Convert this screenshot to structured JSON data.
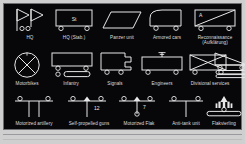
{
  "diagram": {
    "background_color": "#07070a",
    "stroke_color": "#e8e8e8",
    "plate_border_color": "#6e6e72",
    "rows": [
      {
        "items": [
          {
            "label": "HQ",
            "icon": "hq-double-pennant-icon",
            "annotation": ""
          },
          {
            "label": "HQ (Stab.)",
            "icon": "hq-stab-box-icon",
            "annotation": "St"
          },
          {
            "label": "Panzer unit",
            "icon": "panzer-parallelogram-icon",
            "annotation": ""
          },
          {
            "label": "Armored cars",
            "icon": "armored-car-icon",
            "annotation": ""
          },
          {
            "label": "Reconnaissance (Aufklärung)",
            "icon": "reconnaissance-diagonal-icon",
            "annotation": "A"
          }
        ]
      },
      {
        "items": [
          {
            "label": "Motorbikes",
            "icon": "motorbikes-circle-cross-icon",
            "annotation": ""
          },
          {
            "label": "Infantry",
            "icon": "infantry-box-bar-icon",
            "annotation": ""
          },
          {
            "label": "Signals",
            "icon": "signals-flag-notch-icon",
            "annotation": ""
          },
          {
            "label": "Engineers",
            "icon": "engineers-mast-icon",
            "annotation": ""
          },
          {
            "label": "Divisional services",
            "icon": "divisional-services-cross-box-icon",
            "annotation": ""
          },
          {
            "label": "",
            "icon": "supply-column-wedge-icon",
            "annotation": ""
          }
        ]
      },
      {
        "items": [
          {
            "label": "Motorized artillery",
            "icon": "motorized-artillery-icon",
            "annotation": ""
          },
          {
            "label": "Self-propelled guns",
            "icon": "self-propelled-guns-icon",
            "annotation": "12"
          },
          {
            "label": "Motorized Flak",
            "icon": "motorized-flak-icon",
            "annotation": "7"
          },
          {
            "label": "Anti-tank unit",
            "icon": "anti-tank-unit-icon",
            "annotation": ""
          },
          {
            "label": "Flakvierling",
            "icon": "flakvierling-icon",
            "annotation": ""
          }
        ]
      }
    ]
  }
}
